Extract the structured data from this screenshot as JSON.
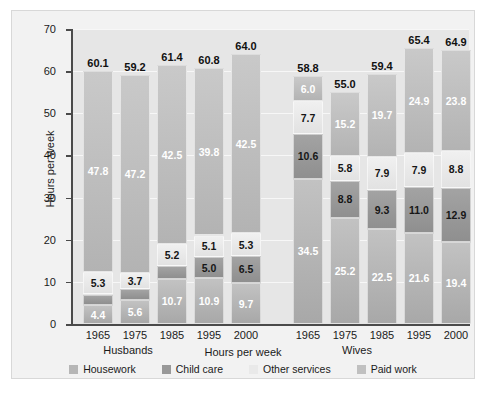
{
  "chart_data": {
    "type": "bar",
    "subtype": "stacked-grouped",
    "title": "",
    "xlabel": "Hours per week",
    "ylabel": "Hours per week",
    "ylim": [
      0,
      70
    ],
    "yticks": [
      0,
      10,
      20,
      30,
      40,
      50,
      60,
      70
    ],
    "grid": true,
    "legend_position": "bottom",
    "groups": [
      "Husbands",
      "Wives"
    ],
    "categories": [
      "1965",
      "1975",
      "1985",
      "1995",
      "2000"
    ],
    "series": [
      {
        "name": "Housework",
        "color": "#b6b6b6",
        "values_husbands": [
          4.4,
          5.6,
          10.7,
          10.9,
          9.7
        ],
        "values_wives": [
          34.5,
          25.2,
          22.5,
          21.6,
          19.4
        ]
      },
      {
        "name": "Child care",
        "color": "#999999",
        "values_husbands": [
          2.6,
          2.7,
          3.0,
          5.0,
          6.5
        ],
        "values_wives": [
          10.6,
          8.8,
          9.3,
          11.0,
          12.9
        ]
      },
      {
        "name": "Other services",
        "color": "#e9e9e9",
        "values_husbands": [
          5.3,
          3.7,
          5.2,
          5.1,
          5.3
        ],
        "values_wives": [
          7.7,
          5.8,
          7.9,
          7.9,
          8.8
        ]
      },
      {
        "name": "Paid work",
        "color": "#c0c0c0",
        "values_husbands": [
          47.8,
          47.2,
          42.5,
          39.8,
          42.5
        ],
        "values_wives": [
          6.0,
          15.2,
          19.7,
          24.9,
          23.8
        ]
      }
    ],
    "totals_husbands": [
      60.1,
      59.2,
      61.4,
      60.8,
      64.0
    ],
    "totals_wives": [
      58.8,
      55.0,
      59.4,
      65.4,
      64.9
    ]
  },
  "axis": {
    "y_title": "Hours per week",
    "x_title": "Hours per week",
    "tick_labels": [
      "70",
      "60",
      "50",
      "40",
      "30",
      "20",
      "10",
      "0"
    ]
  },
  "groups": [
    {
      "label": "Husbands"
    },
    {
      "label": "Wives"
    }
  ],
  "legend": {
    "items": [
      {
        "label": "Housework",
        "swatch": "housework-swatch"
      },
      {
        "label": "Child care",
        "swatch": "childcare-swatch"
      },
      {
        "label": "Other services",
        "swatch": "other-services-swatch"
      },
      {
        "label": "Paid work",
        "swatch": "paid-work-swatch"
      }
    ]
  }
}
